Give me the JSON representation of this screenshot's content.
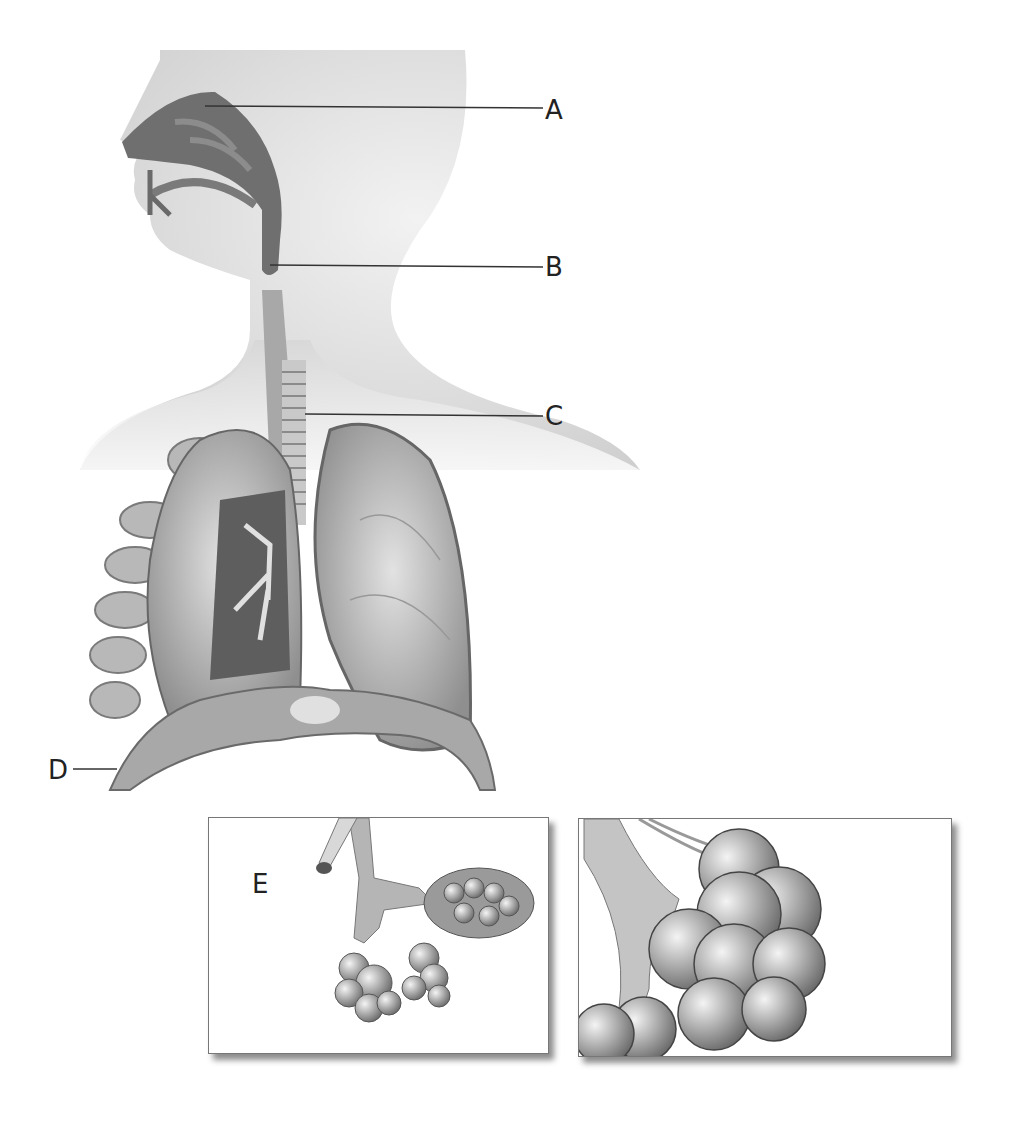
{
  "diagram": {
    "type": "anatomical illustration",
    "labels": [
      {
        "id": "A",
        "text": "A",
        "points_to": "nasal cavity"
      },
      {
        "id": "B",
        "text": "B",
        "points_to": "pharynx / larynx region"
      },
      {
        "id": "C",
        "text": "C",
        "points_to": "trachea"
      },
      {
        "id": "D",
        "text": "D",
        "points_to": "diaphragm"
      },
      {
        "id": "E",
        "text": "E",
        "points_to": "alveoli cluster"
      }
    ],
    "insets": [
      {
        "name": "bronchiole-alveoli-inset",
        "depicts": "bronchiole branching into alveolar sacs"
      },
      {
        "name": "alveoli-closeup-inset",
        "depicts": "close-up of alveoli with capillary network"
      }
    ],
    "colors": {
      "background": "#ffffff",
      "skin": "#e6e6e6",
      "airway_dark": "#6e6e6e",
      "lung": "#bdbdbd",
      "line": "#333333"
    }
  }
}
